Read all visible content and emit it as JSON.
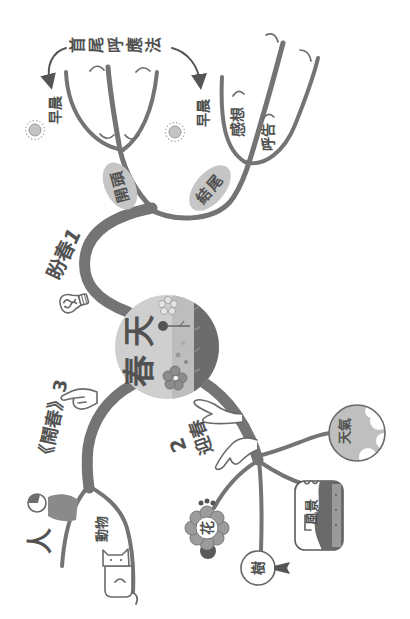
{
  "center": {
    "label": "春天"
  },
  "annotation": {
    "label": "首尾呼應法"
  },
  "branches": {
    "b1": {
      "label": "盼春",
      "number": "1",
      "icon": "lightbulb-icon",
      "opening": {
        "label": "開頭",
        "items": [
          {
            "label": "早晨",
            "icon": "sun-icon"
          }
        ]
      },
      "ending": {
        "label": "結尾",
        "items": [
          {
            "label": "早晨",
            "icon": "sun-icon"
          },
          {
            "label": "感想"
          },
          {
            "label": "呼告"
          }
        ]
      }
    },
    "b2": {
      "label": "迎春",
      "number": "2",
      "icon": "welcoming-hands-icon",
      "items": [
        {
          "label": "天氣",
          "icon": "globe-icon"
        },
        {
          "label": "風景",
          "icon": "landscape-card-icon"
        },
        {
          "label": "樹",
          "icon": "tree-icon"
        },
        {
          "label": "花",
          "icon": "flower-icon"
        }
      ]
    },
    "b3": {
      "label": "鬧春",
      "quote_open": "《",
      "quote_close": "》",
      "number": "3",
      "icon": "pointing-hand-icon",
      "items": [
        {
          "label": "人",
          "icon": "person-icon"
        },
        {
          "label": "動物",
          "icon": "cat-icon"
        }
      ]
    }
  },
  "colors": {
    "background": "#ffffff",
    "branch": "#747474",
    "blob": "#c6c6c6",
    "text": "#525252",
    "center_light": "#cfcfcf",
    "center_dark": "#6c6c6c"
  }
}
